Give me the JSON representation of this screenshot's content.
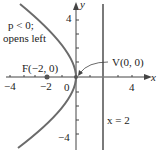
{
  "figure": {
    "parabola": {
      "equation": "y^2 = -8x",
      "p": -2,
      "opens": "left"
    },
    "annotation": [
      "p < 0;",
      "opens left"
    ],
    "focus": {
      "label": "F(−2, 0)",
      "x": -2,
      "y": 0
    },
    "vertex": {
      "label": "V(0, 0)",
      "x": 0,
      "y": 0
    },
    "directrix": {
      "label": "x = 2",
      "x": 2
    },
    "axes": {
      "x_label": "x",
      "y_label": "y",
      "x_ticks": [
        "−4",
        "−2",
        "0",
        "4"
      ],
      "y_ticks": [
        "4",
        "−4"
      ]
    },
    "colors": {
      "curve": "#6b6b6b",
      "axis": "#444444",
      "directrix": "#7a7a7a",
      "point": "#555555"
    }
  }
}
